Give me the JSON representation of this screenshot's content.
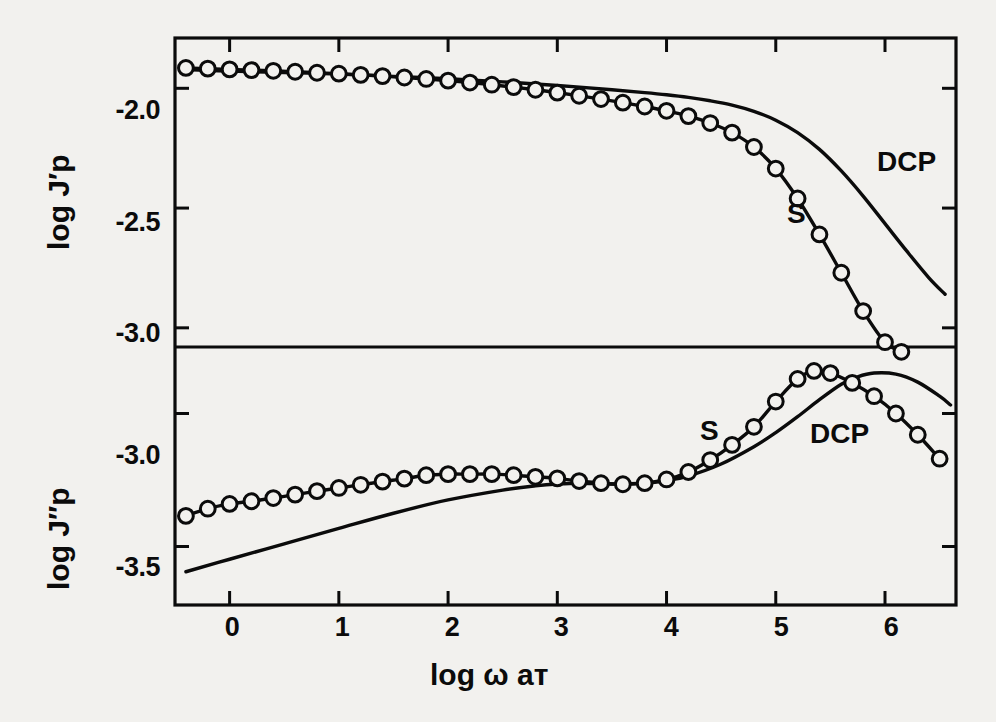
{
  "figure": {
    "background_color": "#f2f1ee",
    "ink_color": "#0b0b0b",
    "panels": 2
  },
  "axes": {
    "x_label_prefix": "log",
    "x_label_omega": "ω",
    "x_label_a": "a",
    "x_label_subscript": "T",
    "x_label_full": "log ω aᴛ",
    "x_ticks": [
      "0",
      "1",
      "2",
      "3",
      "4",
      "5",
      "6"
    ],
    "x_tick_values": [
      0,
      1,
      2,
      3,
      4,
      5,
      6
    ],
    "x_range": [
      -0.5,
      6.65
    ],
    "top_panel": {
      "y_label_prefix": "log",
      "y_label_symbol": "J'p",
      "y_label_full": "log J′p",
      "y_ticks": [
        "-2.0",
        "-2.5",
        "-3.0"
      ],
      "y_tick_values": [
        -2.0,
        -2.5,
        -3.0
      ],
      "y_range": [
        -3.08,
        -1.79
      ]
    },
    "bottom_panel": {
      "y_label_prefix": "log",
      "y_label_symbol": "J\"p",
      "y_label_full": "log J″p",
      "y_ticks": [
        "-3.0",
        "-3.5"
      ],
      "y_tick_values": [
        -3.0,
        -3.5
      ],
      "y_range": [
        -3.72,
        -2.75
      ]
    }
  },
  "curve_labels": {
    "top_dcp": "DCP",
    "top_s": "S",
    "bottom_s": "S",
    "bottom_dcp": "DCP"
  },
  "chart_data": {
    "type": "line",
    "title": "",
    "subtitle": "",
    "xlabel": "log ω aᴛ",
    "grid": false,
    "legend_position": "inline-annotation",
    "marker": "open-circle",
    "panels": [
      {
        "name": "top",
        "ylabel": "log J′p",
        "xlim": [
          -0.5,
          6.65
        ],
        "ylim": [
          -3.08,
          -1.79
        ],
        "xticks": [
          0,
          1,
          2,
          3,
          4,
          5,
          6
        ],
        "yticks": [
          -2.0,
          -2.5,
          -3.0
        ],
        "series": [
          {
            "name": "S",
            "style": "solid-line-with-open-circles",
            "x": [
              -0.4,
              -0.2,
              0.0,
              0.2,
              0.4,
              0.6,
              0.8,
              1.0,
              1.2,
              1.4,
              1.6,
              1.8,
              2.0,
              2.2,
              2.4,
              2.6,
              2.8,
              3.0,
              3.2,
              3.4,
              3.6,
              3.8,
              4.0,
              4.2,
              4.4,
              4.6,
              4.8,
              5.0,
              5.2,
              5.4,
              5.6,
              5.8,
              6.0,
              6.15
            ],
            "y": [
              -1.915,
              -1.918,
              -1.921,
              -1.924,
              -1.927,
              -1.931,
              -1.935,
              -1.939,
              -1.944,
              -1.949,
              -1.955,
              -1.961,
              -1.968,
              -1.976,
              -1.985,
              -1.995,
              -2.006,
              -2.018,
              -2.031,
              -2.045,
              -2.06,
              -2.076,
              -2.094,
              -2.116,
              -2.145,
              -2.185,
              -2.245,
              -2.335,
              -2.46,
              -2.61,
              -2.77,
              -2.93,
              -3.06,
              -3.1
            ]
          },
          {
            "name": "DCP",
            "style": "solid-line",
            "x": [
              -0.4,
              0.0,
              0.5,
              1.0,
              1.5,
              2.0,
              2.5,
              3.0,
              3.5,
              3.8,
              4.0,
              4.2,
              4.4,
              4.6,
              4.8,
              5.0,
              5.2,
              5.4,
              5.6,
              5.8,
              6.0,
              6.2,
              6.4,
              6.55
            ],
            "y": [
              -1.922,
              -1.928,
              -1.934,
              -1.941,
              -1.95,
              -1.96,
              -1.973,
              -1.988,
              -2.006,
              -2.018,
              -2.027,
              -2.038,
              -2.052,
              -2.07,
              -2.096,
              -2.133,
              -2.185,
              -2.255,
              -2.345,
              -2.45,
              -2.565,
              -2.68,
              -2.79,
              -2.86
            ]
          }
        ]
      },
      {
        "name": "bottom",
        "ylabel": "log J″p",
        "xlim": [
          -0.5,
          6.65
        ],
        "ylim": [
          -3.72,
          -2.75
        ],
        "xticks": [
          0,
          1,
          2,
          3,
          4,
          5,
          6
        ],
        "yticks": [
          -3.0,
          -3.5
        ],
        "series": [
          {
            "name": "S",
            "style": "solid-line-with-open-circles",
            "x": [
              -0.4,
              -0.2,
              0.0,
              0.2,
              0.4,
              0.6,
              0.8,
              1.0,
              1.2,
              1.4,
              1.6,
              1.8,
              2.0,
              2.2,
              2.4,
              2.6,
              2.8,
              3.0,
              3.2,
              3.4,
              3.6,
              3.8,
              4.0,
              4.2,
              4.4,
              4.6,
              4.8,
              5.0,
              5.2,
              5.35,
              5.5,
              5.7,
              5.9,
              6.1,
              6.3,
              6.5
            ],
            "y": [
              -3.385,
              -3.358,
              -3.34,
              -3.33,
              -3.318,
              -3.305,
              -3.292,
              -3.28,
              -3.268,
              -3.256,
              -3.245,
              -3.232,
              -3.228,
              -3.228,
              -3.228,
              -3.232,
              -3.238,
              -3.244,
              -3.254,
              -3.262,
              -3.266,
              -3.262,
              -3.248,
              -3.22,
              -3.175,
              -3.118,
              -3.05,
              -2.955,
              -2.87,
              -2.84,
              -2.848,
              -2.885,
              -2.935,
              -3.0,
              -3.08,
              -3.17
            ]
          },
          {
            "name": "DCP",
            "style": "solid-line",
            "x": [
              -0.4,
              0.0,
              0.5,
              1.0,
              1.5,
              2.0,
              2.5,
              2.8,
              3.0,
              3.2,
              3.5,
              3.8,
              4.0,
              4.2,
              4.5,
              4.8,
              5.0,
              5.2,
              5.4,
              5.6,
              5.75,
              5.9,
              6.1,
              6.3,
              6.5,
              6.6
            ],
            "y": [
              -3.595,
              -3.548,
              -3.49,
              -3.432,
              -3.375,
              -3.325,
              -3.288,
              -3.272,
              -3.265,
              -3.262,
              -3.265,
              -3.262,
              -3.252,
              -3.235,
              -3.19,
              -3.125,
              -3.072,
              -3.012,
              -2.948,
              -2.89,
              -2.862,
              -2.848,
              -2.852,
              -2.882,
              -2.935,
              -2.968
            ]
          }
        ]
      }
    ]
  },
  "geometry": {
    "plot_left": 175,
    "plot_right": 956,
    "top_panel_top": 38,
    "panel_divider": 347,
    "bottom_panel_bottom": 605
  }
}
